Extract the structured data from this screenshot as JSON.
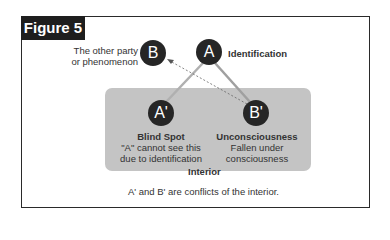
{
  "figure": {
    "label": "Figure 5",
    "caption": "A' and B' are conflicts of the interior."
  },
  "nodes": {
    "B": {
      "letter": "B",
      "label_line1": "The other party",
      "label_line2": "or phenomenon"
    },
    "A": {
      "letter": "A",
      "label": "Identification"
    },
    "A_prime": {
      "letter": "A'",
      "title": "Blind Spot",
      "desc_line1": "\"A\" cannot see this",
      "desc_line2": "due to identification"
    },
    "B_prime": {
      "letter": "B'",
      "title": "Unconsciousness",
      "desc_line1": "Fallen under",
      "desc_line2": "consciousness"
    }
  },
  "interior": {
    "label": "Interior"
  },
  "colors": {
    "node": "#262626",
    "interior_fill": "#c4c4c4",
    "connector": "#aaaaaa",
    "dashed_arrow": "#666666"
  }
}
